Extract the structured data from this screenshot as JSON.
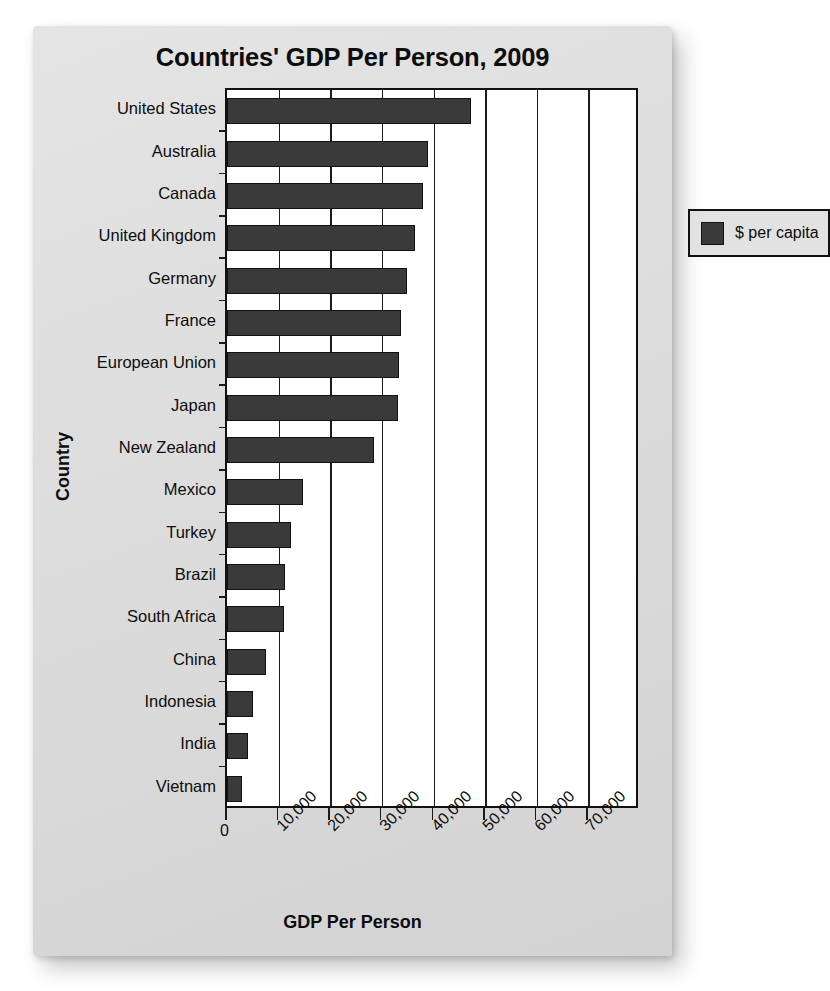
{
  "chart_data": {
    "type": "bar",
    "orientation": "horizontal",
    "title": "Countries' GDP Per Person, 2009",
    "xlabel": "GDP Per Person",
    "ylabel": "Country",
    "categories": [
      "United States",
      "Australia",
      "Canada",
      "United Kingdom",
      "Germany",
      "France",
      "European Union",
      "Japan",
      "New Zealand",
      "Mexico",
      "Turkey",
      "Brazil",
      "South Africa",
      "China",
      "Indonesia",
      "India",
      "Vietnam"
    ],
    "values": [
      47200,
      39000,
      38000,
      36400,
      34800,
      33700,
      33400,
      33200,
      28400,
      14700,
      12400,
      11200,
      11100,
      7600,
      5000,
      4000,
      2900
    ],
    "series": [
      {
        "name": "$ per capita",
        "color": "#3a3a3a",
        "values": [
          47200,
          39000,
          38000,
          36400,
          34800,
          33700,
          33400,
          33200,
          28400,
          14700,
          12400,
          11200,
          11100,
          7600,
          5000,
          4000,
          2900
        ]
      }
    ],
    "xlim": [
      0,
      80000
    ],
    "x_ticks": [
      0,
      10000,
      20000,
      30000,
      40000,
      50000,
      60000,
      70000
    ],
    "x_tick_labels": [
      "0",
      "10,000",
      "20,000",
      "30,000",
      "40,000",
      "50,000",
      "60,000",
      "70,000"
    ],
    "gridlines": true,
    "grid_axis": "x",
    "legend": {
      "position": "top-right",
      "entries": [
        {
          "label": "$ per capita",
          "color": "#3a3a3a"
        }
      ]
    },
    "colors": {
      "bar": "#3a3a3a",
      "bar_border": "#111111",
      "panel_background": "#dedede",
      "plot_background": "#ffffff",
      "axis": "#1b1b1b",
      "text": "#0d0d0d"
    }
  }
}
